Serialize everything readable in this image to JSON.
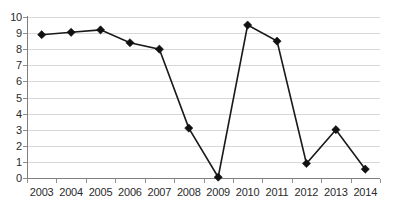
{
  "chart_data": {
    "type": "line",
    "title": "",
    "subtitle": "",
    "xlabel": "",
    "ylabel": "",
    "categories": [
      "2003",
      "2004",
      "2005",
      "2006",
      "2007",
      "2008",
      "2009",
      "2010",
      "2011",
      "2012",
      "2013",
      "2014"
    ],
    "values": [
      8.9,
      9.05,
      9.2,
      8.4,
      8.0,
      3.1,
      0.05,
      9.5,
      8.5,
      0.9,
      3.0,
      0.55
    ],
    "series": [
      {
        "name": "",
        "values": [
          8.9,
          9.05,
          9.2,
          8.4,
          8.0,
          3.1,
          0.05,
          9.5,
          8.5,
          0.9,
          3.0,
          0.55
        ]
      }
    ],
    "ylim": [
      0,
      10
    ],
    "y_ticks": [
      0,
      1,
      2,
      3,
      4,
      5,
      6,
      7,
      8,
      9,
      10
    ],
    "y_tick_labels": [
      "0",
      "1",
      "2",
      "3",
      "4",
      "5",
      "6",
      "7",
      "8",
      "9",
      "10"
    ],
    "x_tick_labels": [
      "2003",
      "2004",
      "2005",
      "2006",
      "2007",
      "2008",
      "2009",
      "2010",
      "2011",
      "2012",
      "2013",
      "2014"
    ],
    "grid": true,
    "grid_axis": "y",
    "legend": false,
    "legend_position": "none",
    "marker": "diamond",
    "line_color": "#1a1a1a",
    "marker_color": "#111111",
    "grid_color": "#d8d8d8",
    "axis_color": "#808080",
    "background_color": "#ffffff",
    "annotations": []
  }
}
